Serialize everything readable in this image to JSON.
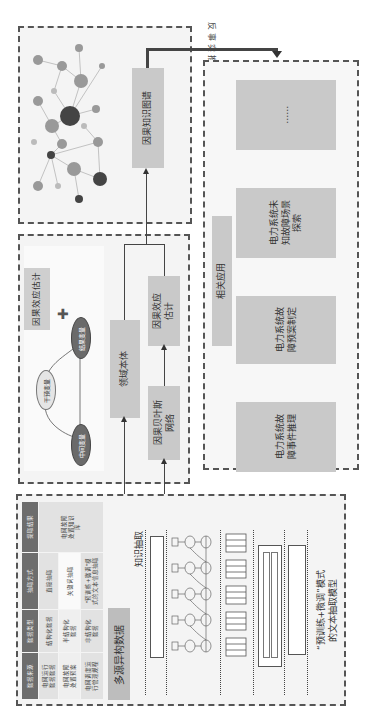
{
  "knowledge_graph": {
    "label": "因果知识图谱"
  },
  "counterfactual": {
    "label": "反事实推理"
  },
  "applications": {
    "title": "相关应用",
    "items": [
      {
        "label": "电力系统故\n障事件推理"
      },
      {
        "label": "电力系统故\n障预案制定"
      },
      {
        "label": "电力系统未\n知故障场景\n探索"
      },
      {
        "label": "……"
      }
    ]
  },
  "causal_panel": {
    "title": "因果效应估计",
    "intervention_var": "干预变量",
    "mediator_var": "中间变量",
    "outcome_var": "结果变量",
    "plus": "✚"
  },
  "middle_flow": {
    "ontology": "领域本体",
    "bayes": "因果贝叶斯\n网络",
    "effect": "因果效应\n估计"
  },
  "source": {
    "multi_source": "多源异构数据",
    "extraction": "知识抽取"
  },
  "table": {
    "headers": [
      "数据来源",
      "数据类型",
      "抽取方式",
      "提取结果"
    ],
    "rows": [
      [
        "电网运行\n数据数据",
        "结构化数据",
        "直接抽取",
        "电网故障\n处置知识\n库"
      ],
      [
        "电网故障\n处置预案",
        "半结构化\n数据",
        "关键词抽取",
        ""
      ],
      [
        "电网调度运\n行管理规程",
        "非结构化\n数据",
        "\"预训练+微调\"模\n式的文本信息抽取",
        ""
      ]
    ]
  },
  "model": {
    "caption": "“预训练+微调”模式\n的文本抽取模型"
  }
}
